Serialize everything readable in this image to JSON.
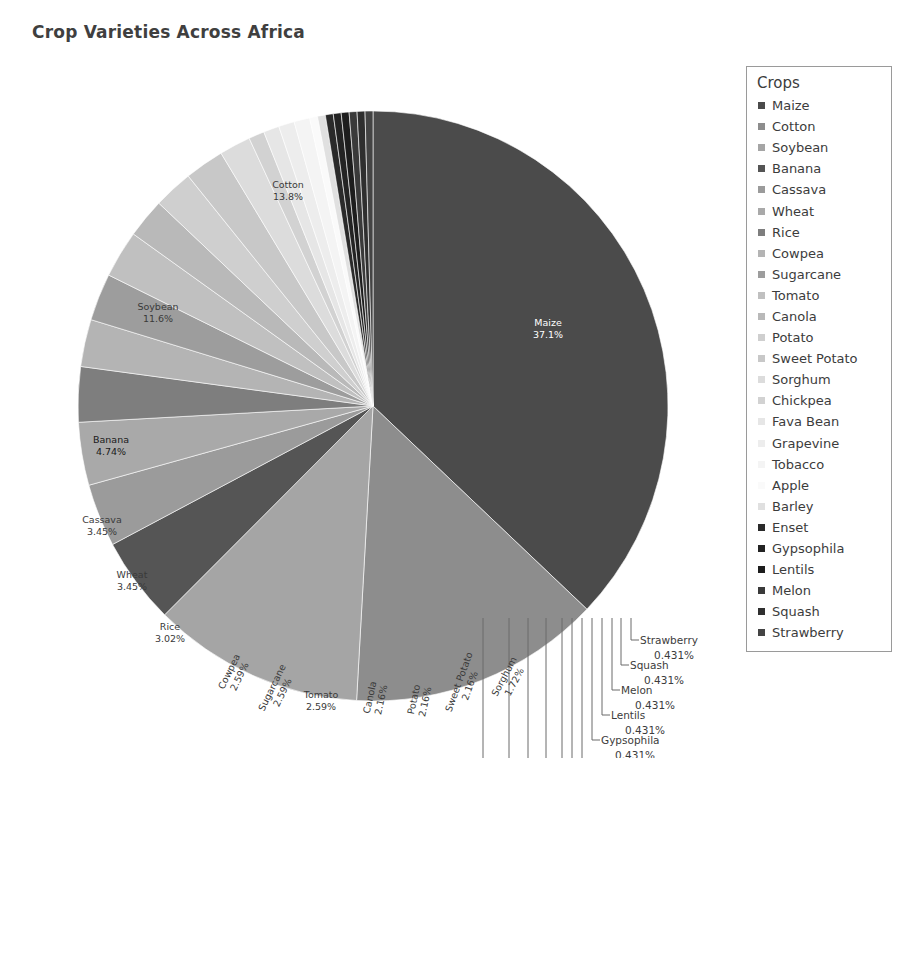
{
  "chart_data": {
    "type": "pie",
    "title": "Crop Varieties Across Africa",
    "legend_title": "Crops",
    "legend_position": "right",
    "units": "percent",
    "start_angle_deg": -90,
    "direction": "clockwise",
    "categories": [
      "Maize",
      "Cotton",
      "Soybean",
      "Banana",
      "Cassava",
      "Wheat",
      "Rice",
      "Cowpea",
      "Sugarcane",
      "Tomato",
      "Canola",
      "Potato",
      "Sweet Potato",
      "Sorghum",
      "Chickpea",
      "Fava Bean",
      "Grapevine",
      "Tobacco",
      "Apple",
      "Barley",
      "Enset",
      "Gypsophila",
      "Lentils",
      "Melon",
      "Squash",
      "Strawberry"
    ],
    "values": [
      37.1,
      13.8,
      11.6,
      4.74,
      3.45,
      3.45,
      3.02,
      2.59,
      2.59,
      2.59,
      2.16,
      2.16,
      2.16,
      1.72,
      0.862,
      0.862,
      0.862,
      0.862,
      0.431,
      0.431,
      0.431,
      0.431,
      0.431,
      0.431,
      0.431,
      0.431
    ],
    "value_labels": [
      "37.1%",
      "13.8%",
      "11.6%",
      "4.74%",
      "3.45%",
      "3.45%",
      "3.02%",
      "2.59%",
      "2.59%",
      "2.59%",
      "2.16%",
      "2.16%",
      "2.16%",
      "1.72%",
      "0.862%",
      "0.862%",
      "0.862%",
      "0.862%",
      "0.431%",
      "0.431%",
      "0.431%",
      "0.431%",
      "0.431%",
      "0.431%",
      "0.431%",
      "0.431%"
    ],
    "colors": [
      "#4b4b4b",
      "#8d8d8d",
      "#a5a5a5",
      "#555555",
      "#9b9b9b",
      "#a9a9a9",
      "#7e7e7e",
      "#b4b4b4",
      "#9d9d9d",
      "#c0c0c0",
      "#b9b9b9",
      "#cfcfcf",
      "#c8c8c8",
      "#dcdcdc",
      "#d2d2d2",
      "#e6e6e6",
      "#ededed",
      "#f4f4f4",
      "#fafafa",
      "#e0e0e0",
      "#2a2a2a",
      "#232323",
      "#1d1d1d",
      "#3a3a3a",
      "#2f2f2f",
      "#444444"
    ],
    "label_text_colors": [
      "#ffffff",
      "#3a3a3a",
      "#3a3a3a",
      "#1a1a1a",
      "#3a3a3a",
      "#3a3a3a",
      "#3a3a3a",
      "#3a3a3a",
      "#3a3a3a",
      "#3a3a3a",
      "#3a3a3a",
      "#3a3a3a",
      "#3a3a3a",
      "#3a3a3a",
      "#3c3c3c",
      "#3c3c3c",
      "#3c3c3c",
      "#3c3c3c",
      "#3c3c3c",
      "#3c3c3c",
      "#3c3c3c",
      "#3c3c3c",
      "#3c3c3c",
      "#3c3c3c",
      "#3c3c3c",
      "#3c3c3c"
    ],
    "inside_labels": [
      {
        "name": "Maize",
        "value": "37.1%",
        "x": 530,
        "y": 268,
        "rot": 0
      },
      {
        "name": "Cotton",
        "value": "13.8%",
        "x": 270,
        "y": 130,
        "rot": 0
      },
      {
        "name": "Soybean",
        "value": "11.6%",
        "x": 140,
        "y": 252,
        "rot": 0
      },
      {
        "name": "Banana",
        "value": "4.74%",
        "x": 93,
        "y": 385,
        "rot": 0
      },
      {
        "name": "Cassava",
        "value": "3.45%",
        "x": 84,
        "y": 465,
        "rot": 0
      },
      {
        "name": "Wheat",
        "value": "3.45%",
        "x": 114,
        "y": 520,
        "rot": 0
      },
      {
        "name": "Rice",
        "value": "3.02%",
        "x": 152,
        "y": 572,
        "rot": 0
      },
      {
        "name": "Cowpea",
        "value": "2.59%",
        "x": 214,
        "y": 615,
        "rot": -64
      },
      {
        "name": "Sugarcane",
        "value": "2.59%",
        "x": 257,
        "y": 631,
        "rot": -64
      },
      {
        "name": "Tomato",
        "value": "2.59%",
        "x": 303,
        "y": 640,
        "rot": 0
      },
      {
        "name": "Canola",
        "value": "2.16%",
        "x": 355,
        "y": 640,
        "rot": -78
      },
      {
        "name": "Potato",
        "value": "2.16%",
        "x": 399,
        "y": 642,
        "rot": -78
      },
      {
        "name": "Sweet Potato",
        "value": "2.16%",
        "x": 444,
        "y": 625,
        "rot": -70
      },
      {
        "name": "Sorghum",
        "value": "1.72%",
        "x": 489,
        "y": 620,
        "rot": -62
      }
    ],
    "leader_labels": [
      {
        "name": "Strawberry",
        "value": "0.431%",
        "text_x": 622,
        "text_y": 586,
        "val_x": 636,
        "val_y": 601
      },
      {
        "name": "Squash",
        "value": "0.431%",
        "text_x": 612,
        "text_y": 611,
        "val_x": 626,
        "val_y": 626
      },
      {
        "name": "Melon",
        "value": "0.431%",
        "text_x": 603,
        "text_y": 636,
        "val_x": 617,
        "val_y": 651
      },
      {
        "name": "Lentils",
        "value": "0.431%",
        "text_x": 593,
        "text_y": 661,
        "val_x": 607,
        "val_y": 676
      },
      {
        "name": "Gypsophila",
        "value": "0.431%",
        "text_x": 583,
        "text_y": 686,
        "val_x": 597,
        "val_y": 701
      },
      {
        "name": "Enset",
        "value": "0.431%",
        "text_x": 573,
        "text_y": 711,
        "val_x": 587,
        "val_y": 726
      },
      {
        "name": "Barley",
        "value": "0.431%",
        "text_x": 563,
        "text_y": 736,
        "val_x": 577,
        "val_y": 751
      },
      {
        "name": "Apple",
        "value": "0.431%",
        "text_x": 553,
        "text_y": 761,
        "val_x": 567,
        "val_y": 776
      },
      {
        "name": "Tobacco",
        "value": "0.862%",
        "text_x": 537,
        "text_y": 786,
        "val_x": 551,
        "val_y": 801
      },
      {
        "name": "Grapevine",
        "value": "0.862%",
        "text_x": 519,
        "text_y": 811,
        "val_x": 533,
        "val_y": 826
      },
      {
        "name": "Fava Bean",
        "value": "0.862%",
        "text_x": 500,
        "text_y": 836,
        "val_x": 514,
        "val_y": 851
      },
      {
        "name": "Chickpea",
        "value": "0.862%",
        "text_x": 474,
        "text_y": 861,
        "val_x": 488,
        "val_y": 876
      }
    ]
  },
  "legend": {
    "title": "Crops",
    "items": [
      {
        "label": "Maize",
        "color": "#4b4b4b"
      },
      {
        "label": "Cotton",
        "color": "#8d8d8d"
      },
      {
        "label": "Soybean",
        "color": "#a5a5a5"
      },
      {
        "label": "Banana",
        "color": "#555555"
      },
      {
        "label": "Cassava",
        "color": "#9b9b9b"
      },
      {
        "label": "Wheat",
        "color": "#a9a9a9"
      },
      {
        "label": "Rice",
        "color": "#7e7e7e"
      },
      {
        "label": "Cowpea",
        "color": "#b4b4b4"
      },
      {
        "label": "Sugarcane",
        "color": "#9d9d9d"
      },
      {
        "label": "Tomato",
        "color": "#c0c0c0"
      },
      {
        "label": "Canola",
        "color": "#b9b9b9"
      },
      {
        "label": "Potato",
        "color": "#cfcfcf"
      },
      {
        "label": "Sweet Potato",
        "color": "#c8c8c8"
      },
      {
        "label": "Sorghum",
        "color": "#dcdcdc"
      },
      {
        "label": "Chickpea",
        "color": "#d2d2d2"
      },
      {
        "label": "Fava Bean",
        "color": "#e6e6e6"
      },
      {
        "label": "Grapevine",
        "color": "#ededed"
      },
      {
        "label": "Tobacco",
        "color": "#f4f4f4"
      },
      {
        "label": "Apple",
        "color": "#fafafa"
      },
      {
        "label": "Barley",
        "color": "#e0e0e0"
      },
      {
        "label": "Enset",
        "color": "#2a2a2a"
      },
      {
        "label": "Gypsophila",
        "color": "#232323"
      },
      {
        "label": "Lentils",
        "color": "#1d1d1d"
      },
      {
        "label": "Melon",
        "color": "#3a3a3a"
      },
      {
        "label": "Squash",
        "color": "#2f2f2f"
      },
      {
        "label": "Strawberry",
        "color": "#444444"
      }
    ]
  }
}
